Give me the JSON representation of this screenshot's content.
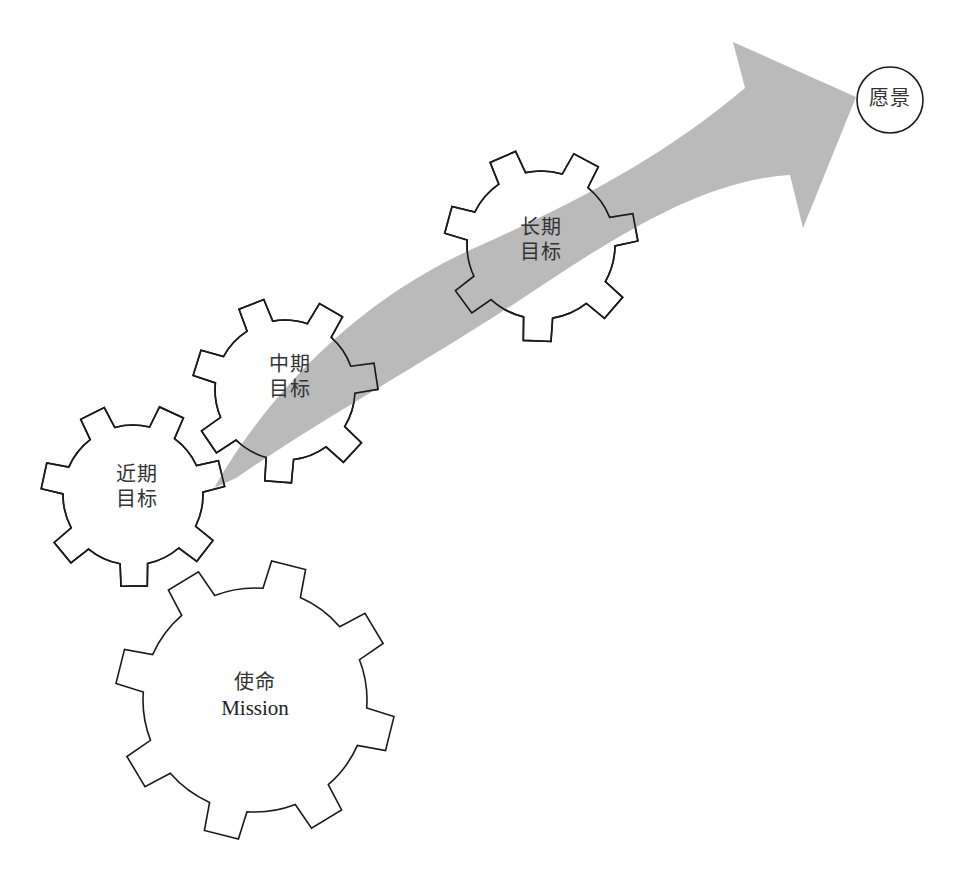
{
  "diagram": {
    "type": "gears-and-arrow",
    "arrow_color": "#b3b3b3",
    "stroke_color": "#1a1a1a",
    "vision": {
      "label": "愿景"
    },
    "gears": [
      {
        "id": "mission",
        "line1": "使命",
        "line2": "Mission"
      },
      {
        "id": "near",
        "line1": "近期",
        "line2": "目标"
      },
      {
        "id": "mid",
        "line1": "中期",
        "line2": "目标"
      },
      {
        "id": "long",
        "line1": "长期",
        "line2": "目标"
      }
    ]
  }
}
